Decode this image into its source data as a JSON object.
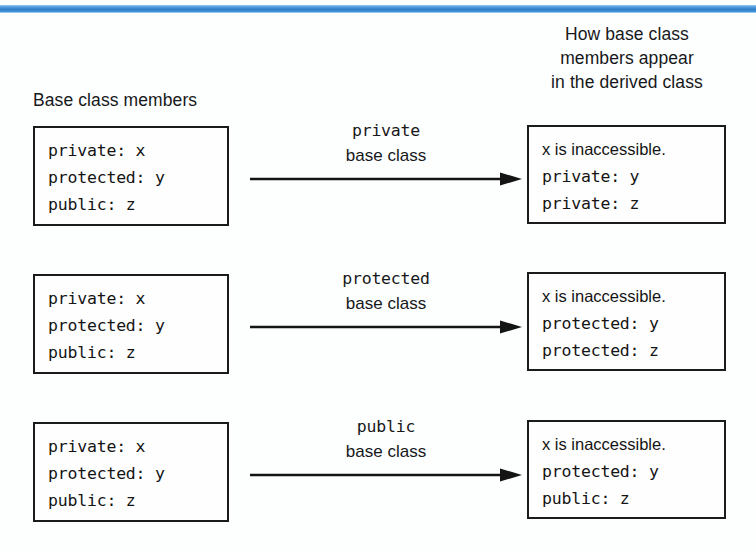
{
  "figure": {
    "accent_color": "#3d8ed6",
    "background_color": "#fdfefe",
    "ink_color": "#141414"
  },
  "headings": {
    "left": "Base class members",
    "right": "How base class\nmembers appear\nin the derived class"
  },
  "rows": [
    {
      "id": "private-inheritance",
      "base_box": {
        "lines": [
          "private: x",
          "protected: y",
          "public: z"
        ]
      },
      "arrow": {
        "keyword": "private",
        "suffix": "base class",
        "icon": "arrow-right-icon"
      },
      "derived_box": {
        "note": "x is inaccessible.",
        "lines": [
          "private: y",
          "private: z"
        ]
      }
    },
    {
      "id": "protected-inheritance",
      "base_box": {
        "lines": [
          "private: x",
          "protected: y",
          "public: z"
        ]
      },
      "arrow": {
        "keyword": "protected",
        "suffix": "base class",
        "icon": "arrow-right-icon"
      },
      "derived_box": {
        "note": "x is inaccessible.",
        "lines": [
          "protected: y",
          "protected: z"
        ]
      }
    },
    {
      "id": "public-inheritance",
      "base_box": {
        "lines": [
          "private: x",
          "protected: y",
          "public: z"
        ]
      },
      "arrow": {
        "keyword": "public",
        "suffix": "base class",
        "icon": "arrow-right-icon"
      },
      "derived_box": {
        "note": "x is inaccessible.",
        "lines": [
          "protected: y",
          "public: z"
        ]
      }
    }
  ]
}
